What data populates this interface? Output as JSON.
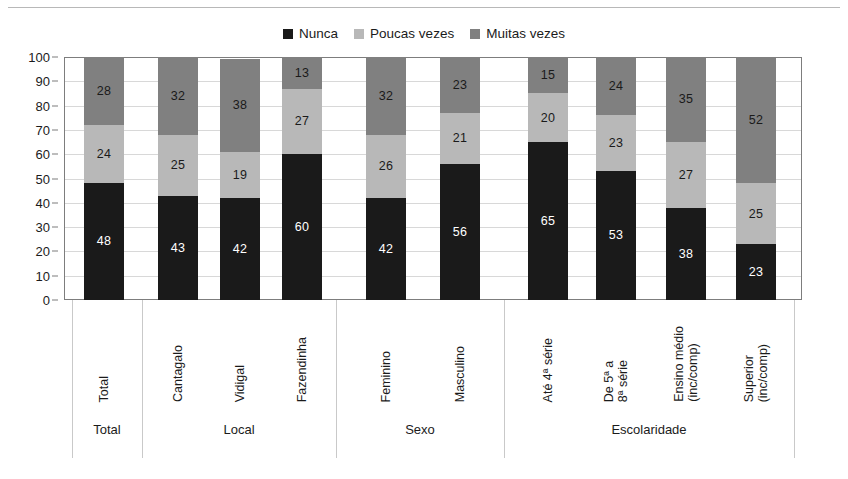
{
  "chart_data": {
    "type": "bar",
    "subtype": "stacked-bar-100",
    "title": "",
    "subtitle": "",
    "xlabel": "",
    "ylabel": "",
    "ylim": [
      0,
      100
    ],
    "yticks": [
      0,
      10,
      20,
      30,
      40,
      50,
      60,
      70,
      80,
      90,
      100
    ],
    "ytick_labels": [
      "0",
      "10",
      "20",
      "30",
      "40",
      "50",
      "60",
      "70",
      "80",
      "90",
      "100"
    ],
    "grid": true,
    "legend_position": "top-center",
    "categories": [
      "Total",
      "Cantagalo",
      "Vidigal",
      "Fazendinha",
      "Feminino",
      "Masculino",
      "Até 4ª série",
      "De 5ª a\n8ª série",
      "Ensino médio\n(inc/comp)",
      "Superior\n(inc/comp)"
    ],
    "series": [
      {
        "name": "Nunca",
        "color": "#1a1a1a",
        "values": [
          48,
          43,
          42,
          60,
          42,
          56,
          65,
          53,
          38,
          23
        ]
      },
      {
        "name": "Poucas vezes",
        "color": "#b8b8b8",
        "values": [
          24,
          25,
          19,
          27,
          26,
          21,
          20,
          23,
          27,
          25
        ]
      },
      {
        "name": "Muitas vezes",
        "color": "#808080",
        "values": [
          28,
          32,
          38,
          13,
          32,
          23,
          15,
          24,
          35,
          52
        ]
      }
    ],
    "groups": [
      {
        "label": "Total",
        "categories": [
          "Total"
        ]
      },
      {
        "label": "Local",
        "categories": [
          "Cantagalo",
          "Vidigal",
          "Fazendinha"
        ]
      },
      {
        "label": "Sexo",
        "categories": [
          "Feminino",
          "Masculino"
        ]
      },
      {
        "label": "Escolaridade",
        "categories": [
          "Até 4ª série",
          "De 5ª a\n8ª série",
          "Ensino médio\n(inc/comp)",
          "Superior\n(inc/comp)"
        ]
      }
    ]
  },
  "legend": {
    "items": [
      {
        "label": "Nunca",
        "color": "#1a1a1a"
      },
      {
        "label": "Poucas vezes",
        "color": "#b8b8b8"
      },
      {
        "label": "Muitas vezes",
        "color": "#808080"
      }
    ]
  },
  "axis": {
    "y_labels": [
      "100",
      "90",
      "80",
      "70",
      "60",
      "50",
      "40",
      "30",
      "20",
      "10",
      "0"
    ]
  },
  "colors": {
    "nunca": "#1a1a1a",
    "poucas_vezes": "#b8b8b8",
    "muitas_vezes": "#808080",
    "gridline": "#d8d8d8",
    "frame": "#7d7d7d",
    "background": "#ffffff",
    "text": "#1b1b1b"
  }
}
